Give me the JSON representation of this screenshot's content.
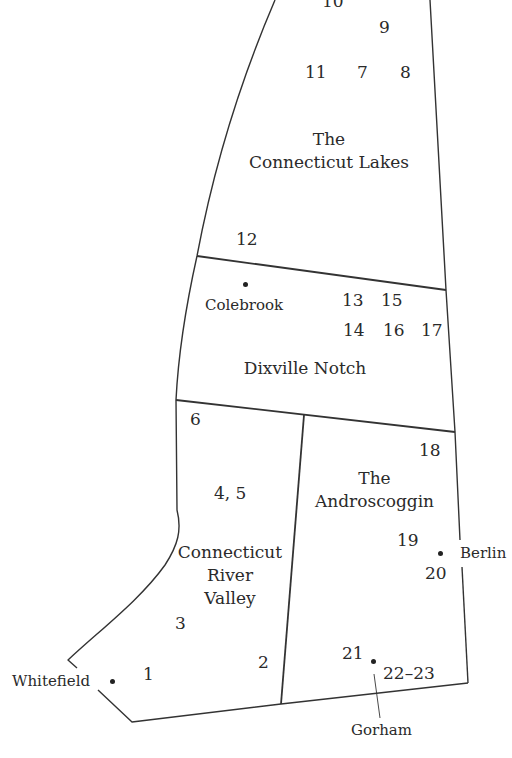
{
  "map": {
    "regions": [
      {
        "name": "The Connecticut Lakes",
        "line1": "The",
        "line2": "Connecticut Lakes"
      },
      {
        "name": "Dixville Notch",
        "line1": "Dixville Notch"
      },
      {
        "name": "Connecticut River Valley",
        "line1": "Connecticut",
        "line2": "River",
        "line3": "Valley"
      },
      {
        "name": "The Androscoggin",
        "line1": "The",
        "line2": "Androscoggin"
      }
    ],
    "towns": {
      "colebrook": "Colebrook",
      "whitefield": "Whitefield",
      "berlin": "Berlin",
      "gorham": "Gorham"
    },
    "sites": {
      "s1": "1",
      "s2": "2",
      "s3": "3",
      "s45": "4, 5",
      "s6": "6",
      "s7": "7",
      "s8": "8",
      "s9": "9",
      "s10": "10",
      "s11": "11",
      "s12": "12",
      "s13": "13",
      "s14": "14",
      "s15": "15",
      "s16": "16",
      "s17": "17",
      "s18": "18",
      "s19": "19",
      "s20": "20",
      "s21": "21",
      "s2223": "22–23"
    },
    "line_color": "#333333",
    "text_color": "#2a2a2a"
  }
}
